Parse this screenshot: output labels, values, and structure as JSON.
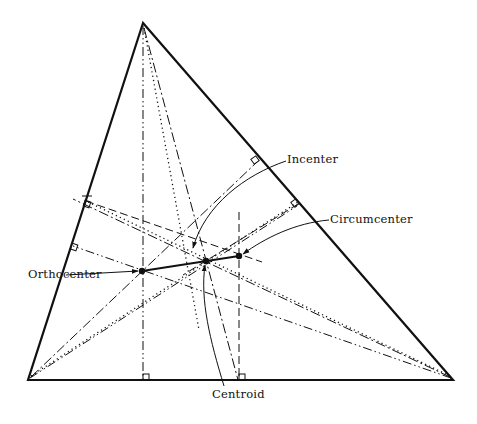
{
  "diagram": {
    "vertices": {
      "A": [
        143,
        23
      ],
      "B": [
        28,
        380
      ],
      "C": [
        453,
        380
      ]
    },
    "points": {
      "orthocenter": [
        142,
        271
      ],
      "centroid": [
        206,
        261
      ],
      "circumcenter": [
        239,
        256
      ],
      "incenter": [
        192,
        252
      ]
    },
    "labels": {
      "incenter": "Incenter",
      "circumcenter": "Circumcenter",
      "orthocenter": "Orthocenter",
      "centroid": "Centroid"
    },
    "legend_line_styles": {
      "altitudes": "dash-dot-dot",
      "medians": "dotted",
      "perpendicular_bisectors": "dash",
      "angle_bisectors": "dash-dot"
    },
    "colors": {
      "ink": "#111111",
      "background": "#ffffff"
    }
  }
}
